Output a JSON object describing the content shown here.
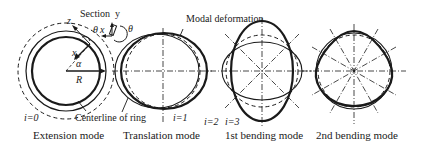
{
  "figure": {
    "panels": [
      {
        "id": "extension",
        "caption": "Extension mode",
        "index_label": "i=0"
      },
      {
        "id": "translation",
        "caption": "Translation mode",
        "index_label": "i=1"
      },
      {
        "id": "first-bending",
        "caption": "1st bending mode",
        "index_label": "i=2"
      },
      {
        "id": "second-bending",
        "caption": "2nd bending mode",
        "index_label": "i=3"
      }
    ],
    "annotations": {
      "section": "Section",
      "y_axis": "y",
      "x_axis": "x",
      "theta1": "θ",
      "theta2": "θ",
      "z_axis": "z",
      "x_local": "x",
      "alpha": "α",
      "radius": "R",
      "modal_deformation": "Modal deformation",
      "centerline": "Centerline of ring"
    },
    "colors": {
      "line": "#1a1a1a",
      "background": "#ffffff"
    }
  }
}
